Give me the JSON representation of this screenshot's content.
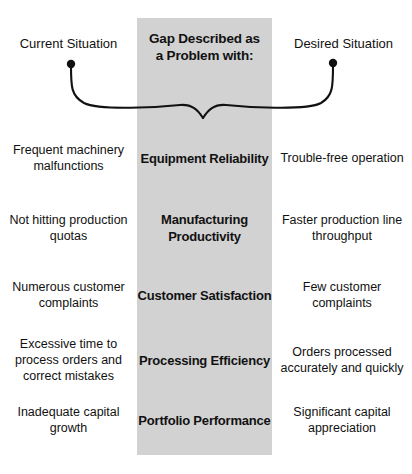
{
  "diagram": {
    "title": "Gap Described as a Problem with:",
    "band_color": "#d2d2d2",
    "band_title_line1": "Gap Described as",
    "band_title_line2": "a Problem with:",
    "header_left": "Current Situation",
    "header_right": "Desired Situation",
    "rows": [
      {
        "left": "Frequent machinery malfunctions",
        "center": "Equipment Reliability",
        "right": "Trouble-free operation"
      },
      {
        "left": "Not hitting production quotas",
        "center": "Manufacturing Productivity",
        "right": "Faster production line throughput"
      },
      {
        "left": "Numerous customer complaints",
        "center": "Customer Satisfaction",
        "right": "Few customer complaints"
      },
      {
        "left": "Excessive time to process orders and correct mistakes",
        "center": "Processing Efficiency",
        "right": "Orders processed accurately and quickly"
      },
      {
        "left": "Inadequate capital growth",
        "center": "Portfolio Performance",
        "right": "Significant capital appreciation"
      }
    ]
  }
}
